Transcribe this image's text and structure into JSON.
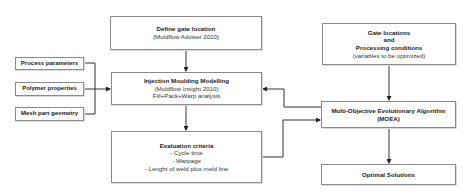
{
  "diagram": {
    "define_gate": {
      "title": "Define gate location",
      "subtitle": "(Moldflow Adviser 2010)"
    },
    "inputs": [
      {
        "label": "Process parameters"
      },
      {
        "label": "Polymer properties"
      },
      {
        "label": "Mesh part geometry"
      }
    ],
    "injection": {
      "title": "Injection Moulding Modelling",
      "line1": "(Moldflow Insight 2010)",
      "line2": "Fill+Pack+Warp analysis"
    },
    "evaluation": {
      "title": "Evaluation criteria",
      "items": [
        "- Cycle time",
        "- Warpage",
        "- Lenght of weld plus meld line"
      ]
    },
    "gate_vars": {
      "line1": "Gate locations",
      "line2": "and",
      "line3": "Processing conditions",
      "line4": "(variables to be optimized)"
    },
    "moea": {
      "line1": "Multi-Objective Evolutionary Algorithm",
      "line2": "(MOEA)"
    },
    "optimal": {
      "label": "Optimal Solutions"
    }
  }
}
